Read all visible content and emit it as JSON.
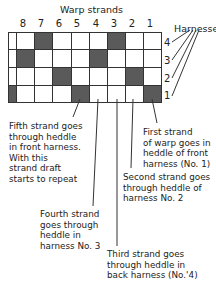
{
  "title": "Warp strands",
  "harnesses_label": "Harnesses",
  "columns": [
    "8",
    "7",
    "6",
    "5",
    "4",
    "3",
    "2",
    "1"
  ],
  "rows": [
    {
      "harness": "4",
      "filled": [
        false,
        false,
        true,
        false,
        false,
        false,
        true,
        false,
        false
      ]
    },
    {
      "harness": "3",
      "filled": [
        false,
        true,
        false,
        false,
        false,
        true,
        false,
        false,
        false
      ]
    },
    {
      "harness": "2",
      "filled": [
        false,
        false,
        false,
        true,
        false,
        false,
        false,
        true,
        false
      ]
    },
    {
      "harness": "1",
      "filled": [
        true,
        false,
        false,
        false,
        true,
        false,
        false,
        false,
        true
      ]
    }
  ],
  "annotations": {
    "fifth": "Fifth strand goes\nthrough heddle\nin front harness.\nWith this\nstrand draft\nstarts to repeat",
    "fourth": "Fourth strand\ngoes through\nheddle in\nharness No. 3",
    "third": "Third strand goes\nthrough heddle in\nback harness (No.'4)",
    "second": "Second strand goes\nthrough heddle of\nharness No. 2",
    "first": "First strand\nof warp goes in\nheddle of front\nharness (No. 1)"
  },
  "colors": {
    "filled": "#5a5a5a",
    "line": "#333333"
  }
}
